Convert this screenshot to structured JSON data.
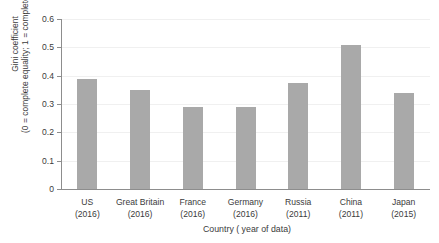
{
  "chart_data": {
    "type": "bar",
    "title": "",
    "xlabel": "Country ( year of data)",
    "ylabel_line1": "Gini coefficient",
    "ylabel_line2": "(0 = complete equality; 1 = complete inequality)",
    "categories": [
      "US",
      "Great Britain",
      "France",
      "Germany",
      "Russia",
      "China",
      "Japan"
    ],
    "years": [
      "(2016)",
      "(2016)",
      "(2016)",
      "(2016)",
      "(2011)",
      "(2011)",
      "(2015)"
    ],
    "values": [
      0.39,
      0.35,
      0.29,
      0.29,
      0.375,
      0.51,
      0.34
    ],
    "ylim": [
      0,
      0.6
    ],
    "yticks": [
      0,
      0.1,
      0.2,
      0.3,
      0.4,
      0.5,
      0.6
    ],
    "ytick_labels": [
      "0",
      "0.1",
      "0.2",
      "0.3",
      "0.4",
      "0.5",
      "0.6"
    ],
    "grid": true,
    "legend": "none",
    "bar_color": "#a9a9a9",
    "axis_color": "#8d8d8d",
    "grid_color": "#f0f0f0",
    "background": "#ffffff"
  }
}
